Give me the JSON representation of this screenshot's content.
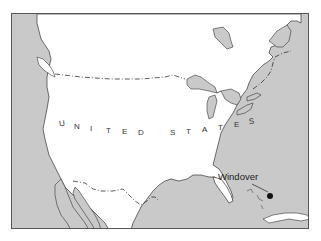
{
  "map": {
    "region": "North America",
    "colors": {
      "water": "#c9c9c9",
      "land": "#ffffff",
      "outline": "#333333",
      "border": "#555555"
    },
    "country_label": {
      "text": "UNITED STATES",
      "letters": [
        "U",
        "N",
        "I",
        "T",
        "E",
        "D",
        "S",
        "T",
        "A",
        "T",
        "E",
        "S"
      ]
    },
    "places": [
      {
        "name": "Windover",
        "marker": "dot"
      }
    ],
    "boundaries": [
      "US-Canada border (dash-dot)",
      "US-Mexico border (dash-dot)"
    ]
  }
}
